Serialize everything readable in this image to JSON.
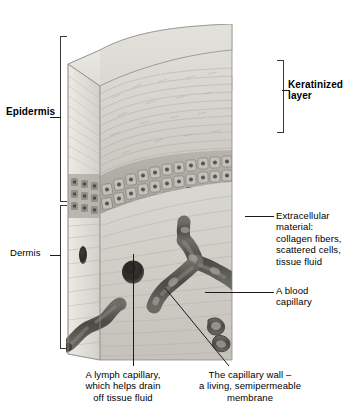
{
  "labels": {
    "epidermis": "Epidermis",
    "keratinized_layer": "Keratinized\nlayer",
    "dermis": "Dermis",
    "extracellular_material": "Extracellular\nmaterial:\ncollagen fibers,\nscattered cells,\ntissue fluid",
    "blood_capillary": "A blood\ncapillary",
    "lymph_capillary": "A lymph capillary,\nwhich helps drain\noff tissue fluid",
    "capillary_wall": "The capillary wall –\na living, semipermeable\nmembrane"
  },
  "colors": {
    "ink": "#000000",
    "leader": "#1a1a1a",
    "bracket": "#3a3a3a",
    "tissue_light": "#e8e7e3",
    "tissue_mid": "#cfcdc7",
    "tissue_dark": "#9c9a94",
    "vessel": "#585751",
    "background": "#ffffff"
  },
  "structures": {
    "keratinized_scales": "polygonal surface scale cells",
    "stratified_layers": "wavy horizontal keratin fiber bands",
    "basal_cells": "cuboidal nucleated cell rows",
    "dermis_matrix": "wavy collagen fiber bands",
    "vessels": [
      "branching blood capillary",
      "lymph capillary pore",
      "small vessel pair",
      "serpentine vessel on cut face"
    ]
  }
}
